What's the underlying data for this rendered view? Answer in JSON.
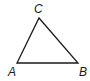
{
  "diagram": {
    "type": "triangle",
    "vertices": [
      {
        "name": "A",
        "label": "A",
        "x": 17,
        "y": 63,
        "lx": 8,
        "ly": 76
      },
      {
        "name": "B",
        "label": "B",
        "x": 78,
        "y": 63,
        "lx": 79,
        "ly": 76
      },
      {
        "name": "C",
        "label": "C",
        "x": 39,
        "y": 18,
        "lx": 34,
        "ly": 13
      }
    ],
    "stroke_color": "#1a1a1a"
  }
}
